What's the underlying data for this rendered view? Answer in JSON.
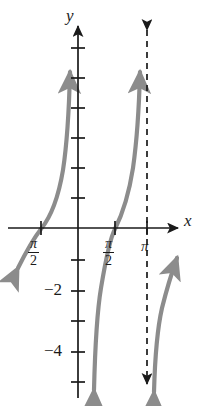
{
  "figure": {
    "type": "function-graph",
    "axis_labels": {
      "x": "x",
      "y": "y"
    },
    "x_ticks": [
      {
        "label": "π/2",
        "numerator": "π",
        "denominator": "2",
        "value": -1.5708,
        "px": 41,
        "negative_side": true
      },
      {
        "label": "π/2",
        "numerator": "π",
        "denominator": "2",
        "value": 1.5708,
        "px": 115,
        "negative_side": false
      },
      {
        "label": "π",
        "numerator": "π",
        "denominator": "",
        "value": 3.1416,
        "px": 147,
        "negative_side": false
      }
    ],
    "y_ticks": [
      {
        "label": "",
        "value": 6,
        "px": 48
      },
      {
        "label": "",
        "value": 5,
        "px": 78
      },
      {
        "label": "",
        "value": 4,
        "px": 108
      },
      {
        "label": "",
        "value": 3,
        "px": 138
      },
      {
        "label": "",
        "value": 2,
        "px": 168
      },
      {
        "label": "",
        "value": 1,
        "px": 198
      },
      {
        "label": "",
        "value": -1,
        "px": 260
      },
      {
        "label": "-2",
        "value": -2,
        "px": 291
      },
      {
        "label": "",
        "value": -3,
        "px": 321
      },
      {
        "label": "-4",
        "value": -4,
        "px": 352
      },
      {
        "label": "",
        "value": -5,
        "px": 382
      }
    ],
    "y_tick_labels": [
      "−2",
      "−4"
    ],
    "origin_px": {
      "x": 78,
      "y": 228
    },
    "asymptote": {
      "at_label": "π",
      "style": "dashed",
      "px_x": 147,
      "double_arrow": true
    },
    "curve": {
      "style": "solid",
      "color": "#8a8a8a",
      "branches": 3,
      "arrowheads": [
        "down-left-lower-left",
        "up-top-left",
        "down-bottom-middle",
        "up-top-middle",
        "up-top-right",
        "down-bottom-right"
      ]
    },
    "colors": {
      "axis": "#1a1a1a",
      "curve": "#8c8c8c",
      "background": "#ffffff",
      "asymptote": "#1a1a1a"
    }
  }
}
